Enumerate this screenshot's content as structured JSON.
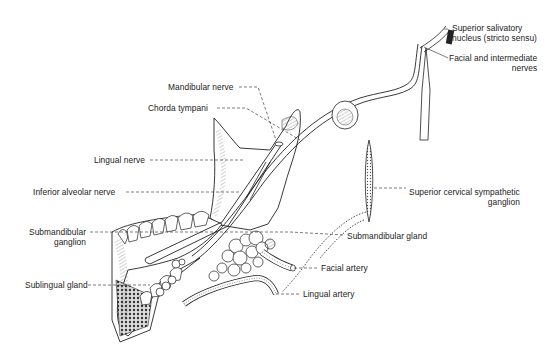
{
  "diagram": {
    "labels": {
      "superior_salivatory_line1": "Superior salivatory",
      "superior_salivatory_line2": "nucleus  (stricto sensu)",
      "facial_intermediate_line1": "Facial and intermediate",
      "facial_intermediate_line2": "nerves",
      "mandibular_nerve": "Mandibular nerve",
      "chorda_tympani": "Chorda tympani",
      "lingual_nerve": "Lingual nerve",
      "inferior_alveolar_nerve": "Inferior alveolar nerve",
      "superior_cervical_line1": "Superior cervical sympathetic",
      "superior_cervical_line2": "ganglion",
      "submandibular_ganglion_line1": "Submandibular",
      "submandibular_ganglion_line2": "ganglion",
      "submandibular_gland": "Submandibular gland",
      "facial_artery": "Facial artery",
      "sublingual_gland": "Sublingual gland",
      "lingual_artery": "Lingual artery"
    },
    "colors": {
      "ink": "#222222",
      "background": "#ffffff",
      "shade": "#888888"
    }
  }
}
